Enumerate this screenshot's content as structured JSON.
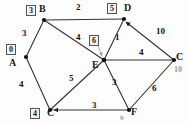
{
  "diagram": {
    "type": "graph",
    "colors": {
      "edge": "#333333",
      "node": "#111111",
      "box_border": "#555555",
      "grey": "#9a9a9a"
    },
    "nodes": [
      {
        "id": "A",
        "label": "A",
        "box": "0",
        "x": 26,
        "y": 57
      },
      {
        "id": "B",
        "label": "B",
        "box": "3",
        "x": 44,
        "y": 20
      },
      {
        "id": "C",
        "label": "C",
        "box": "4",
        "x": 50,
        "y": 110
      },
      {
        "id": "D",
        "label": "D",
        "box": "5",
        "x": 124,
        "y": 19
      },
      {
        "id": "E",
        "label": "E",
        "box": "6",
        "x": 104,
        "y": 60
      },
      {
        "id": "C2",
        "label": "C",
        "box": "10",
        "x": 174,
        "y": 60
      }
    ],
    "node_label_positions": {
      "A": {
        "x": 9,
        "y": 58
      },
      "B": {
        "x": 39,
        "y": 4
      },
      "C": {
        "x": 47,
        "y": 108
      },
      "D": {
        "x": 124,
        "y": 3
      },
      "E": {
        "x": 92,
        "y": 60
      },
      "C2": {
        "x": 176,
        "y": 52
      }
    },
    "box_positions": {
      "A": {
        "x": 6,
        "y": 44
      },
      "B": {
        "x": 26,
        "y": 5
      },
      "C": {
        "x": 30,
        "y": 108
      },
      "D": {
        "x": 107,
        "y": 3
      },
      "E": {
        "x": 89,
        "y": 35
      },
      "C2": {
        "x": 176,
        "y": 63
      }
    },
    "edges": [
      {
        "from": "A",
        "to": "B",
        "weight": "3",
        "lx": 22,
        "ly": 31,
        "directed": false
      },
      {
        "from": "B",
        "to": "D",
        "weight": "2",
        "lx": 76,
        "ly": 4,
        "directed": false
      },
      {
        "from": "B",
        "to": "E",
        "weight": "4",
        "lx": 76,
        "ly": 35,
        "directed": false
      },
      {
        "from": "A",
        "to": "C",
        "weight": "4",
        "lx": 20,
        "ly": 82,
        "directed": false
      },
      {
        "from": "C",
        "to": "E",
        "weight": "5",
        "lx": 69,
        "ly": 75,
        "directed": false
      },
      {
        "from": "D",
        "to": "E",
        "weight": "1",
        "lx": 114,
        "ly": 35,
        "directed": false
      },
      {
        "from": "C2",
        "to": "D",
        "weight": "10",
        "lx": 155,
        "ly": 28,
        "directed": true
      },
      {
        "from": "E",
        "to": "C2",
        "weight": "4",
        "lx": 140,
        "ly": 49,
        "directed": false
      },
      {
        "from": "E",
        "to": "F",
        "weight": "3",
        "lx": 113,
        "ly": 80,
        "directed": false
      },
      {
        "from": "F",
        "to": "C2",
        "weight": "6",
        "lx": 153,
        "ly": 85,
        "directed": false
      },
      {
        "from": "F",
        "to": "C",
        "weight": "3",
        "lx": 93,
        "ly": 104,
        "directed": true
      }
    ],
    "extra_nodes": [
      {
        "id": "F",
        "label": "F",
        "x": 129,
        "y": 110,
        "lx": 131,
        "ly": 108
      }
    ],
    "annotations": [
      {
        "name": "f-small-number",
        "text": "9",
        "x": 118,
        "y": 115,
        "style": "tiny"
      },
      {
        "name": "c2-grey-distance",
        "text": "10",
        "x": 174,
        "y": 67,
        "style": "grey-small"
      }
    ]
  }
}
